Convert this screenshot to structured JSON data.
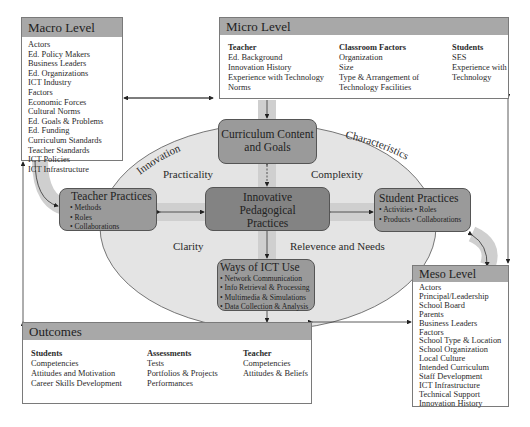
{
  "macro": {
    "title": "Macro Level",
    "items": [
      "Actors",
      "Ed. Policy Makers",
      "Business Leaders",
      "Ed. Organizations",
      "ICT Industry",
      "Factors",
      "Economic Forces",
      "Cultural Norms",
      "Ed. Goals & Problems",
      "Ed. Funding",
      "Curriculum Standards",
      "Teacher Standards",
      "ICT Policies",
      "ICT Infrastructure"
    ]
  },
  "micro": {
    "title": "Micro Level",
    "columns": [
      {
        "heading": "Teacher",
        "items": [
          "Ed. Background",
          "Innovation History",
          "Experience with Technology",
          "Norms"
        ]
      },
      {
        "heading": "Classroom Factors",
        "items": [
          "Organization",
          "Size",
          "Type & Arrangement of",
          "Technology Facilities"
        ]
      },
      {
        "heading": "Students",
        "items": [
          "SES",
          "Experience with",
          "Technology"
        ]
      }
    ]
  },
  "meso": {
    "title": "Meso Level",
    "items": [
      "Actors",
      "Principal/Leadership",
      "School Board",
      "Parents",
      "Business Leaders",
      "Factors",
      "School Type & Location",
      "School Organization",
      "Local Culture",
      "Intended Curriculum",
      "Staff Development",
      "ICT Infrastructure",
      "Technical Support",
      "Innovation History"
    ]
  },
  "outcomes": {
    "title": "Outcomes",
    "columns": [
      {
        "heading": "Students",
        "items": [
          "Competencies",
          "Attitudes and Motivation",
          "Career Skills Development"
        ]
      },
      {
        "heading": "Assessments",
        "items": [
          "Tests",
          "Portfolios & Projects",
          "Performances"
        ]
      },
      {
        "heading": "Teacher",
        "items": [
          "Competencies",
          "Attitudes & Beliefs"
        ]
      }
    ]
  },
  "nodes": {
    "curriculum": {
      "line1": "Curriculum Content",
      "line2": "and Goals"
    },
    "innovative": {
      "line1": "Innovative",
      "line2": "Pedagogical",
      "line3": "Practices"
    },
    "teacher": {
      "title": "Teacher Practices",
      "bullets": [
        "• Methods",
        "• Roles",
        "• Collaborations"
      ]
    },
    "student": {
      "title": "Student Practices",
      "bullets": [
        "• Activities  • Roles",
        "• Products  • Collaborations"
      ]
    },
    "ict": {
      "title": "Ways of ICT Use",
      "bullets": [
        "• Network Communication",
        "• Info Retrieval & Processing",
        "• Multimedia & Simulations",
        "• Data Collection & Analysis"
      ]
    }
  },
  "ellipse_labels": {
    "innovation": "Innovation",
    "characteristics": "Characteristics",
    "practicality": "Practicality",
    "complexity": "Complexity",
    "clarity": "Clarity",
    "relevance": "Relevence and Needs"
  },
  "colors": {
    "ellipse_fill": "#e4e4e4",
    "band": "#cfcfcf",
    "node_mid": "#9a9a9a",
    "node_dark": "#838383",
    "panel_header": "#a8a8a8",
    "line": "#333333"
  }
}
